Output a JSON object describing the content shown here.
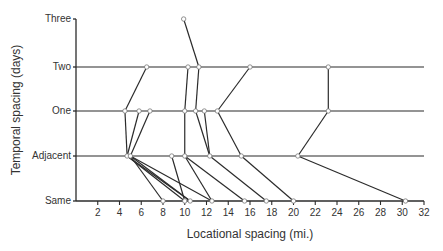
{
  "chart_data": {
    "type": "line",
    "title": "",
    "xlabel": "Locational spacing  (mi.)",
    "ylabel": "Temporal  spacing  (days)",
    "xlim": [
      0,
      32
    ],
    "x_ticks": [
      2,
      4,
      6,
      8,
      10,
      12,
      14,
      16,
      18,
      20,
      22,
      24,
      26,
      28,
      30,
      32
    ],
    "y_categories": [
      "Same",
      "Adjacent",
      "One",
      "Two",
      "Three"
    ],
    "grid": false,
    "legend": null,
    "reference_lines": [
      {
        "level": "Two",
        "x_start": 0,
        "x_end": 32
      },
      {
        "level": "One",
        "x_start": 0,
        "x_end": 32
      },
      {
        "level": "Adjacent",
        "x_start": 0,
        "x_end": 32
      }
    ],
    "nodes": [
      {
        "id": "T1",
        "level": "Three",
        "x": 9.9
      },
      {
        "id": "W1",
        "level": "Two",
        "x": 6.5
      },
      {
        "id": "W2",
        "level": "Two",
        "x": 10.3
      },
      {
        "id": "W3",
        "level": "Two",
        "x": 11.3
      },
      {
        "id": "W4",
        "level": "Two",
        "x": 16.0
      },
      {
        "id": "W5",
        "level": "Two",
        "x": 23.2
      },
      {
        "id": "O1",
        "level": "One",
        "x": 4.5
      },
      {
        "id": "O2",
        "level": "One",
        "x": 5.8
      },
      {
        "id": "O3",
        "level": "One",
        "x": 6.8
      },
      {
        "id": "O4",
        "level": "One",
        "x": 10.0
      },
      {
        "id": "O5",
        "level": "One",
        "x": 11.0
      },
      {
        "id": "O6",
        "level": "One",
        "x": 11.8
      },
      {
        "id": "O7",
        "level": "One",
        "x": 13.0
      },
      {
        "id": "O8",
        "level": "One",
        "x": 23.2
      },
      {
        "id": "A1",
        "level": "Adjacent",
        "x": 4.7
      },
      {
        "id": "A2",
        "level": "Adjacent",
        "x": 5.0
      },
      {
        "id": "A3",
        "level": "Adjacent",
        "x": 8.8
      },
      {
        "id": "A4",
        "level": "Adjacent",
        "x": 10.0
      },
      {
        "id": "A5",
        "level": "Adjacent",
        "x": 12.3
      },
      {
        "id": "A6",
        "level": "Adjacent",
        "x": 15.2
      },
      {
        "id": "A7",
        "level": "Adjacent",
        "x": 20.4
      },
      {
        "id": "S1",
        "level": "Same",
        "x": 8.0
      },
      {
        "id": "S2",
        "level": "Same",
        "x": 10.0
      },
      {
        "id": "S3",
        "level": "Same",
        "x": 10.5
      },
      {
        "id": "S4",
        "level": "Same",
        "x": 12.5
      },
      {
        "id": "S5",
        "level": "Same",
        "x": 15.5
      },
      {
        "id": "S6",
        "level": "Same",
        "x": 17.5
      },
      {
        "id": "S7",
        "level": "Same",
        "x": 20.0
      },
      {
        "id": "S8",
        "level": "Same",
        "x": 30.3
      }
    ],
    "edges": [
      [
        "T1",
        "W3"
      ],
      [
        "W1",
        "O1"
      ],
      [
        "W2",
        "O4"
      ],
      [
        "W3",
        "O5"
      ],
      [
        "W5",
        "O8"
      ],
      [
        "W4",
        "O7"
      ],
      [
        "O1",
        "A1"
      ],
      [
        "O2",
        "A1"
      ],
      [
        "O3",
        "A2"
      ],
      [
        "O4",
        "A4"
      ],
      [
        "O5",
        "A5"
      ],
      [
        "O6",
        "A5"
      ],
      [
        "O7",
        "A6"
      ],
      [
        "O8",
        "A7"
      ],
      [
        "A1",
        "S2"
      ],
      [
        "A1",
        "S3"
      ],
      [
        "A2",
        "S4"
      ],
      [
        "A2",
        "S3"
      ],
      [
        "A3",
        "S2"
      ],
      [
        "A4",
        "S5"
      ],
      [
        "A4",
        "S4"
      ],
      [
        "A5",
        "S6"
      ],
      [
        "A6",
        "S7"
      ],
      [
        "A7",
        "S8"
      ],
      [
        "A2",
        "S1"
      ]
    ]
  },
  "axis_labels": {
    "x": "Locational spacing  (mi.)",
    "y": "Temporal  spacing  (days)"
  },
  "categories": {
    "three": "Three",
    "two": "Two",
    "one": "One",
    "adjacent": "Adjacent",
    "same": "Same"
  },
  "ticks": [
    "2",
    "4",
    "6",
    "8",
    "10",
    "12",
    "14",
    "16",
    "18",
    "20",
    "22",
    "24",
    "26",
    "28",
    "30",
    "32"
  ]
}
